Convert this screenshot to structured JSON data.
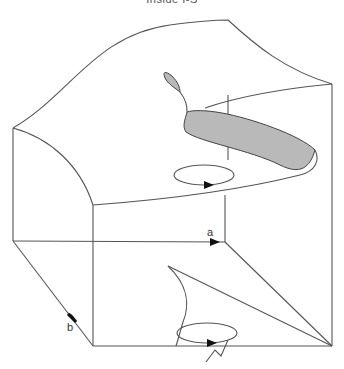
{
  "figure": {
    "caption_cut": "Inside I-S",
    "axis_labels": {
      "a": "a",
      "b": "b"
    },
    "colors": {
      "line": "#555555",
      "fold_fill": "#b9b9b9",
      "arrow": "#111111"
    }
  }
}
